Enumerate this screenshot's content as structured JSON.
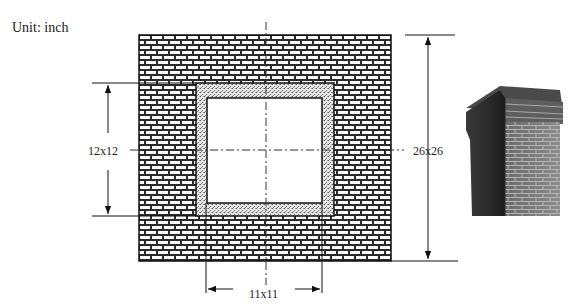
{
  "unit_label": "Unit: inch",
  "dimensions": {
    "outer": "26x26",
    "liner_outer": "12x12",
    "flue_inner": "11x11"
  },
  "colors": {
    "line": "#111111",
    "brick_mortar": "#ffffff",
    "brick_fill": "#2a2a2a",
    "liner_fill": "#d9d9d9",
    "chimney_dark": "#2e2e2e",
    "chimney_mid": "#6b6b6b",
    "chimney_light": "#9a9a9a"
  },
  "figure": {
    "photo_label": "brick-chimney-photo"
  }
}
